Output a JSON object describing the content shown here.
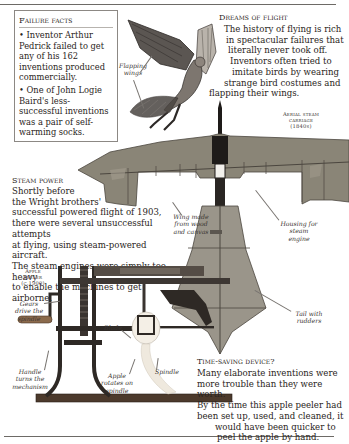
{
  "page": {
    "top_rule": true,
    "bottom_rule": true
  },
  "failure_facts": {
    "title": "Failure facts",
    "items": [
      "• Inventor Arthur Pedrick failed to get any of his 162 inventions produced commercially.",
      "• One of John Logie Baird's less-successful inventions was a pair of self-warming socks.",
      "• Electric bicycles failed because the batteries were too heavy."
    ]
  },
  "dreams_of_flight": {
    "heading": "Dreams of flight",
    "lines": [
      "The history of flying is rich",
      "in spectacular failures that",
      "literally never took off.",
      "Inventors often tried to",
      "imitate birds by wearing",
      "strange bird costumes and",
      "flapping their wings."
    ]
  },
  "flying_man": {
    "label": "Flapping wings"
  },
  "aerial_steam_carriage": {
    "caption_line1": "Aerial steam",
    "caption_line2": "carriage",
    "caption_line3": "(1840s)",
    "labels": {
      "wing": "Wing made from wood and canvas",
      "housing": "Housing for steam engine",
      "tail": "Tail with rudders"
    },
    "colors": {
      "canvas": "#8a8577",
      "frame": "#4b463f",
      "engine": "#1e1b19"
    }
  },
  "steam_power": {
    "heading": "Steam power",
    "lines": [
      "Shortly before",
      "the Wright brothers'",
      "successful powered flight of 1903,",
      "there were several unsuccessful attempts",
      "at flying, using steam-powered aircraft.",
      "The steam engines were simply too heavy",
      "to enable the machines to get airborne."
    ]
  },
  "apple_peeler": {
    "caption_line1": "Apple",
    "caption_line2": "peeler",
    "caption_line3": "(c.1900)",
    "labels": {
      "gears": "Gears drive the spindle",
      "handle": "Handle turns the mechanism",
      "blade": "Blade",
      "apple": "Apple rotates on spindle",
      "spindle": "Spindle"
    }
  },
  "time_saving": {
    "heading": "Time-saving device?",
    "lines": [
      "Many elaborate inventions were",
      "more trouble than they were worth.",
      "By the time this apple peeler had",
      "been set up, used, and cleaned, it",
      "would have been quicker to",
      "peel the apple by hand."
    ]
  }
}
